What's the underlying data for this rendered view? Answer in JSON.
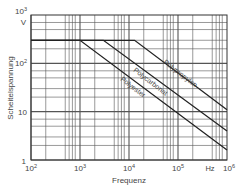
{
  "chart_data": {
    "type": "line",
    "title": "",
    "xlabel": "Frequenz",
    "ylabel": "Scheitelspannung",
    "x_unit": "Hz",
    "y_unit": "V",
    "xscale": "log",
    "yscale": "log",
    "xlim": [
      100,
      1000000
    ],
    "ylim": [
      1,
      1000
    ],
    "grid": true,
    "x_ticks": [
      "10²",
      "10³",
      "10⁴",
      "10⁵",
      "10⁶"
    ],
    "y_ticks": [
      "1",
      "10",
      "10²",
      "10³"
    ],
    "legend": "inline labels along lines",
    "series": [
      {
        "name": "Polyester",
        "points": [
          [
            100,
            300
          ],
          [
            1000,
            300
          ],
          [
            1000000,
            1.6
          ]
        ]
      },
      {
        "name": "Polycarbonat",
        "points": [
          [
            100,
            300
          ],
          [
            3000,
            300
          ],
          [
            1000000,
            4
          ]
        ]
      },
      {
        "name": "Polypropylen",
        "points": [
          [
            100,
            300
          ],
          [
            13000,
            300
          ],
          [
            1000000,
            11
          ]
        ]
      }
    ]
  },
  "labels": {
    "x_title": "Frequenz",
    "y_title": "Scheitelspannung",
    "x_unit": "Hz",
    "y_unit": "V",
    "x_ticks": [
      {
        "base": "10",
        "exp": "2"
      },
      {
        "base": "10",
        "exp": "3"
      },
      {
        "base": "10",
        "exp": "4"
      },
      {
        "base": "10",
        "exp": "5"
      },
      {
        "base": "10",
        "exp": "6"
      }
    ],
    "y_ticks": [
      {
        "base": "1",
        "exp": ""
      },
      {
        "base": "10",
        "exp": ""
      },
      {
        "base": "10",
        "exp": "2"
      },
      {
        "base": "10",
        "exp": "3"
      }
    ],
    "series_labels": [
      "Polyester",
      "Polycarbonat",
      "Polypropylen"
    ]
  }
}
